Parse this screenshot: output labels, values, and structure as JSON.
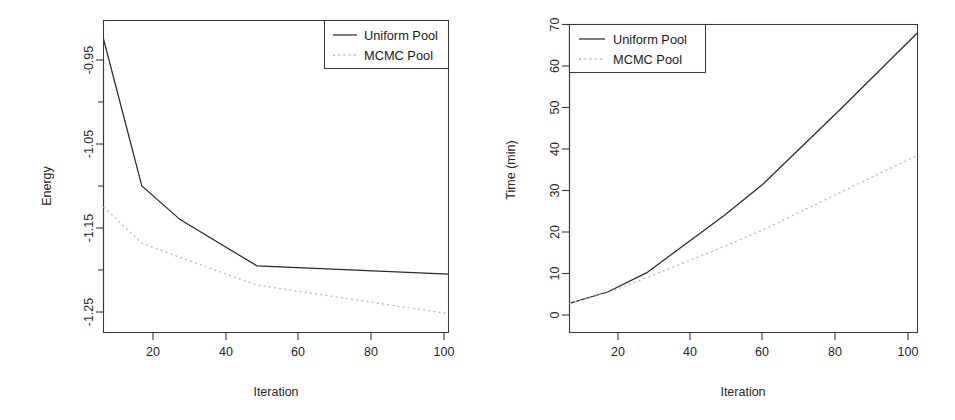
{
  "figure": {
    "background": "#ffffff",
    "ink_color": "#2b2b2b",
    "dotted_color": "#b9b9b9",
    "panel_count": 2
  },
  "legend": {
    "series": [
      {
        "label": "Uniform Pool",
        "key": "solid-line-key"
      },
      {
        "label": "MCMC Pool",
        "key": "dotted-line-key"
      }
    ]
  },
  "chart_data": [
    {
      "id": "energy-panel",
      "type": "line",
      "title": "",
      "xlabel": "Iteration",
      "ylabel": "Energy",
      "x": [
        10,
        20,
        30,
        50,
        100
      ],
      "xlim": [
        10,
        100
      ],
      "ylim": [
        -1.27,
        -0.92
      ],
      "xticks": [
        20,
        40,
        60,
        80,
        100
      ],
      "xtick_labels": [
        "20",
        "40",
        "60",
        "80",
        "100"
      ],
      "yticks": [
        -0.95,
        -1.05,
        -1.15,
        -1.25
      ],
      "ytick_labels": [
        "-0.95",
        "-1.05",
        "-1.15",
        "-1.25"
      ],
      "yticks_minor": [
        -1.0,
        -1.1,
        -1.2
      ],
      "grid": false,
      "legend_position": "top-right",
      "series": [
        {
          "name": "Uniform Pool",
          "style": "solid",
          "values": [
            -0.925,
            -1.1,
            -1.14,
            -1.195,
            -1.205
          ]
        },
        {
          "name": "MCMC Pool",
          "style": "dotted",
          "values": [
            -1.125,
            -1.168,
            -1.185,
            -1.218,
            -1.252
          ]
        }
      ]
    },
    {
      "id": "time-panel",
      "type": "line",
      "title": "",
      "xlabel": "Iteration",
      "ylabel": "Time (min)",
      "x": [
        10,
        20,
        30,
        50,
        60,
        80,
        100
      ],
      "xlim": [
        10,
        100
      ],
      "ylim": [
        0,
        70
      ],
      "xticks": [
        20,
        40,
        60,
        80,
        100
      ],
      "xtick_labels": [
        "20",
        "40",
        "60",
        "80",
        "100"
      ],
      "yticks": [
        0,
        10,
        20,
        30,
        40,
        50,
        60,
        70
      ],
      "ytick_labels": [
        "0",
        "10",
        "20",
        "30",
        "40",
        "50",
        "60",
        "70"
      ],
      "grid": false,
      "legend_position": "top-left",
      "series": [
        {
          "name": "Uniform Pool",
          "style": "solid",
          "values": [
            2.8,
            5.6,
            10.2,
            24.0,
            31.5,
            49.5,
            68.0
          ]
        },
        {
          "name": "MCMC Pool",
          "style": "dotted",
          "values": [
            2.8,
            5.4,
            9.0,
            16.5,
            20.5,
            29.5,
            38.5
          ]
        }
      ]
    }
  ]
}
